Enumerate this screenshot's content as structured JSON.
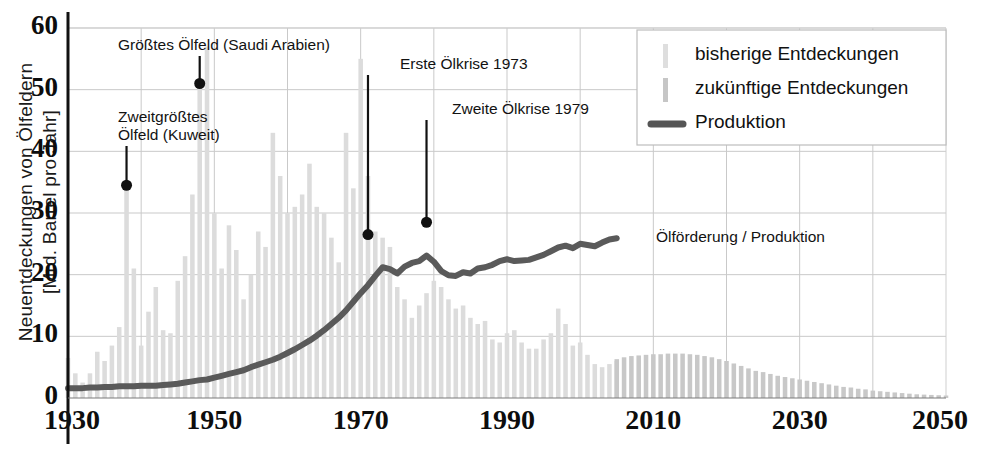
{
  "axes": {
    "ylabel": "Neuentdeckungen von Ölfeldern\n[Mrd. Barrel pro Jahr]",
    "yticks": [
      "0",
      "10",
      "20",
      "30",
      "40",
      "50",
      "60"
    ],
    "xticks": [
      "1930",
      "1950",
      "1970",
      "1990",
      "2010",
      "2030",
      "2050"
    ]
  },
  "legend": {
    "items": [
      {
        "label": "bisherige Entdeckungen",
        "marker": "bar-light",
        "color": "#dcdcdc"
      },
      {
        "label": "zukünftige Entdeckungen",
        "marker": "bar-dark",
        "color": "#c4c4c4"
      },
      {
        "label": "Produktion",
        "marker": "line",
        "color": "#555555"
      }
    ]
  },
  "annotations": [
    {
      "name": "largest-oilfield",
      "text": "Größtes Ölfeld (Saudi Arabien)",
      "year": 1948,
      "value": 51
    },
    {
      "name": "second-largest-oilfield",
      "text": "Zweitgrößtes\nÖlfeld (Kuweit)",
      "year": 1938,
      "value": 34.5
    },
    {
      "name": "first-oil-crisis",
      "text": "Erste Ölkrise 1973",
      "year": 1971,
      "value": 26.5
    },
    {
      "name": "second-oil-crisis",
      "text": "Zweite Ölkrise 1979",
      "year": 1979,
      "value": 28.5
    },
    {
      "name": "production-inline-label",
      "text": "Ölförderung / Produktion",
      "year": 2012,
      "value": 26
    }
  ],
  "chart_data": {
    "type": "bar",
    "title": "",
    "xlabel": "",
    "ylabel": "Neuentdeckungen von Ölfeldern [Mrd. Barrel pro Jahr]",
    "xlim": [
      1930,
      2050
    ],
    "ylim": [
      0,
      60
    ],
    "grid": true,
    "legend_position": "top-right",
    "x": [
      1930,
      1931,
      1932,
      1933,
      1934,
      1935,
      1936,
      1937,
      1938,
      1939,
      1940,
      1941,
      1942,
      1943,
      1944,
      1945,
      1946,
      1947,
      1948,
      1949,
      1950,
      1951,
      1952,
      1953,
      1954,
      1955,
      1956,
      1957,
      1958,
      1959,
      1960,
      1961,
      1962,
      1963,
      1964,
      1965,
      1966,
      1967,
      1968,
      1969,
      1970,
      1971,
      1972,
      1973,
      1974,
      1975,
      1976,
      1977,
      1978,
      1979,
      1980,
      1981,
      1982,
      1983,
      1984,
      1985,
      1986,
      1987,
      1988,
      1989,
      1990,
      1991,
      1992,
      1993,
      1994,
      1995,
      1996,
      1997,
      1998,
      1999,
      2000,
      2001,
      2002,
      2003,
      2004,
      2005,
      2006,
      2007,
      2008,
      2009,
      2010,
      2011,
      2012,
      2013,
      2014,
      2015,
      2016,
      2017,
      2018,
      2019,
      2020,
      2021,
      2022,
      2023,
      2024,
      2025,
      2026,
      2027,
      2028,
      2029,
      2030,
      2031,
      2032,
      2033,
      2034,
      2035,
      2036,
      2037,
      2038,
      2039,
      2040,
      2041,
      2042,
      2043,
      2044,
      2045,
      2046,
      2047,
      2048,
      2049,
      2050
    ],
    "series": [
      {
        "name": "bisherige Entdeckungen",
        "type": "bar",
        "color": "#dcdcdc",
        "values": [
          6.5,
          4.0,
          2.5,
          4.0,
          7.5,
          6.0,
          8.5,
          11.5,
          34.5,
          21.0,
          8.5,
          14.0,
          18.0,
          11.0,
          10.5,
          19.0,
          23.0,
          33.0,
          51.0,
          57.0,
          30.0,
          21.0,
          28.0,
          24.0,
          16.0,
          20.0,
          27.0,
          24.5,
          43.0,
          36.0,
          30.0,
          31.0,
          33.0,
          38.0,
          31.0,
          30.0,
          26.0,
          22.0,
          43.0,
          34.0,
          55.0,
          36.0,
          27.0,
          26.0,
          24.5,
          18.0,
          16.0,
          13.0,
          15.0,
          17.0,
          19.0,
          18.0,
          16.0,
          14.5,
          15.0,
          13.0,
          12.0,
          12.5,
          9.5,
          9.0,
          10.5,
          11.0,
          9.0,
          8.0,
          8.0,
          9.5,
          10.5,
          14.5,
          12.0,
          8.5,
          9.0,
          7.0,
          5.5,
          5.0,
          5.5,
          6.0,
          null,
          null,
          null,
          null,
          null,
          null,
          null,
          null,
          null,
          null,
          null,
          null,
          null,
          null,
          null,
          null,
          null,
          null,
          null,
          null,
          null,
          null,
          null,
          null,
          null,
          null,
          null,
          null,
          null,
          null,
          null,
          null,
          null,
          null,
          null,
          null,
          null,
          null,
          null,
          null,
          null,
          null,
          null,
          null,
          null
        ]
      },
      {
        "name": "zukünftige Entdeckungen",
        "type": "bar",
        "color": "#c8c8c8",
        "values": [
          null,
          null,
          null,
          null,
          null,
          null,
          null,
          null,
          null,
          null,
          null,
          null,
          null,
          null,
          null,
          null,
          null,
          null,
          null,
          null,
          null,
          null,
          null,
          null,
          null,
          null,
          null,
          null,
          null,
          null,
          null,
          null,
          null,
          null,
          null,
          null,
          null,
          null,
          null,
          null,
          null,
          null,
          null,
          null,
          null,
          null,
          null,
          null,
          null,
          null,
          null,
          null,
          null,
          null,
          null,
          null,
          null,
          null,
          null,
          null,
          null,
          null,
          null,
          null,
          null,
          null,
          null,
          null,
          null,
          null,
          null,
          null,
          null,
          null,
          null,
          6.3,
          6.6,
          6.8,
          6.9,
          7.0,
          7.1,
          7.1,
          7.2,
          7.2,
          7.2,
          7.1,
          7.0,
          6.8,
          6.6,
          6.3,
          6.0,
          5.6,
          5.2,
          4.8,
          4.4,
          4.2,
          3.9,
          3.6,
          3.4,
          3.2,
          3.0,
          2.8,
          2.6,
          2.4,
          2.2,
          2.0,
          1.8,
          1.7,
          1.5,
          1.4,
          1.2,
          1.1,
          1.0,
          0.9,
          0.8,
          0.7,
          0.6,
          0.55,
          0.5,
          0.45,
          0.4
        ]
      },
      {
        "name": "Produktion",
        "type": "line",
        "color": "#5a5a5a",
        "values": [
          1.6,
          1.6,
          1.6,
          1.7,
          1.7,
          1.8,
          1.8,
          1.9,
          1.9,
          1.9,
          2.0,
          2.0,
          2.0,
          2.1,
          2.2,
          2.3,
          2.5,
          2.7,
          2.9,
          3.0,
          3.3,
          3.6,
          3.9,
          4.2,
          4.5,
          5.0,
          5.4,
          5.8,
          6.2,
          6.7,
          7.3,
          7.9,
          8.6,
          9.3,
          10.1,
          11.0,
          12.0,
          13.0,
          14.2,
          15.6,
          17.0,
          18.3,
          19.8,
          21.2,
          20.9,
          20.2,
          21.3,
          21.9,
          22.2,
          23.1,
          22.1,
          20.6,
          19.9,
          19.8,
          20.4,
          20.2,
          21.0,
          21.2,
          21.6,
          22.2,
          22.5,
          22.2,
          22.3,
          22.4,
          22.8,
          23.2,
          23.8,
          24.4,
          24.7,
          24.3,
          25.0,
          24.8,
          24.6,
          25.2,
          25.7,
          25.9,
          null,
          null,
          null,
          null,
          null,
          null,
          null,
          null,
          null,
          null,
          null,
          null,
          null,
          null,
          null,
          null,
          null,
          null,
          null,
          null,
          null,
          null,
          null,
          null,
          null,
          null,
          null,
          null,
          null,
          null,
          null,
          null,
          null,
          null,
          null,
          null,
          null,
          null,
          null,
          null,
          null,
          null,
          null,
          null,
          null
        ]
      }
    ]
  }
}
